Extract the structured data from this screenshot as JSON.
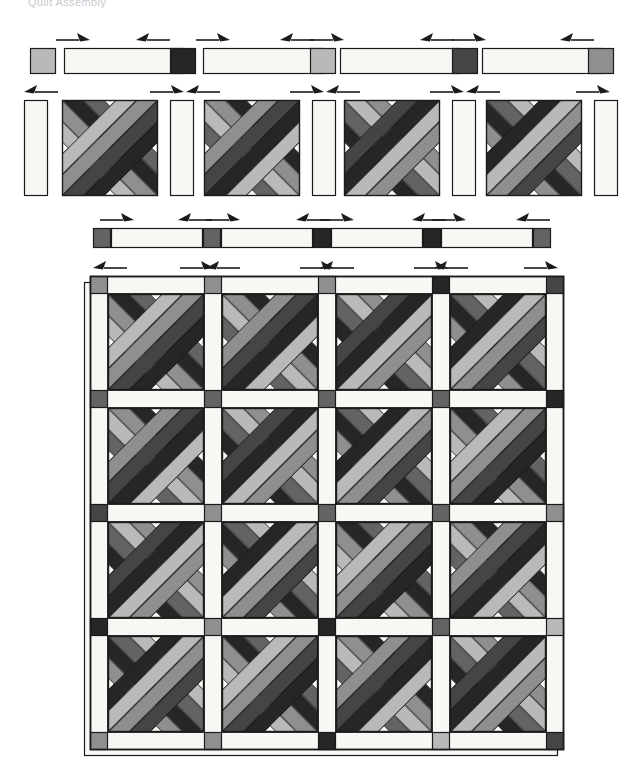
{
  "document": {
    "title": "Quilt Assembly Diagram",
    "caption_partial": "Quilt Assembly",
    "background": "#ffffff",
    "width": 637,
    "height": 761
  },
  "palette": {
    "background": "#ffffff",
    "outline": "#1b1b1b",
    "fabric_white": "#f7f7f4",
    "fabric_offwhite": "#efefea",
    "fabric_light_gray": "#b9b9b9",
    "fabric_medium_gray": "#8f8f8f",
    "fabric_dark_gray": "#636363",
    "fabric_charcoal": "#454545",
    "fabric_black": "#262626",
    "arrow_color": "#1b1b1b"
  },
  "legend": {
    "fabric_names": [
      "white background",
      "light gray",
      "medium gray",
      "dark gray",
      "charcoal",
      "black"
    ]
  },
  "rows": [
    {
      "id": "row-1-sashing-strip",
      "name": "Top sashing row",
      "y": 48,
      "height": 26,
      "pieces": [
        {
          "type": "cornerstone",
          "shade": "fabric_light_gray",
          "x": 30,
          "w": 26
        },
        {
          "type": "sashing",
          "shade": "fabric_white",
          "x": 64,
          "w": 120
        },
        {
          "type": "cornerstone",
          "shade": "fabric_black",
          "x": 170,
          "w": 26
        },
        {
          "type": "sashing",
          "shade": "fabric_white",
          "x": 203,
          "w": 120
        },
        {
          "type": "cornerstone",
          "shade": "fabric_light_gray",
          "x": 310,
          "w": 26
        },
        {
          "type": "sashing",
          "shade": "fabric_white",
          "x": 340,
          "w": 120
        },
        {
          "type": "cornerstone",
          "shade": "fabric_charcoal",
          "x": 452,
          "w": 26
        },
        {
          "type": "sashing",
          "shade": "fabric_white",
          "x": 482,
          "w": 120
        },
        {
          "type": "cornerstone",
          "shade": "fabric_medium_gray",
          "x": 588,
          "w": 26
        }
      ],
      "arrows": [
        {
          "x": 56,
          "y": 40,
          "dir": "right"
        },
        {
          "x": 136,
          "y": 40,
          "dir": "left"
        },
        {
          "x": 196,
          "y": 40,
          "dir": "right"
        },
        {
          "x": 280,
          "y": 40,
          "dir": "left"
        },
        {
          "x": 310,
          "y": 40,
          "dir": "right"
        },
        {
          "x": 420,
          "y": 40,
          "dir": "left"
        },
        {
          "x": 452,
          "y": 40,
          "dir": "right"
        },
        {
          "x": 560,
          "y": 40,
          "dir": "left"
        }
      ]
    },
    {
      "id": "row-2-block-row",
      "name": "Block row with vertical sashing",
      "y": 100,
      "height": 96,
      "pieces": [
        {
          "type": "sashing-vertical",
          "shade": "fabric_white",
          "x": 24,
          "w": 24
        },
        {
          "type": "x-block",
          "variant": 0,
          "x": 62,
          "w": 96
        },
        {
          "type": "sashing-vertical",
          "shade": "fabric_white",
          "x": 170,
          "w": 24
        },
        {
          "type": "x-block",
          "variant": 1,
          "x": 204,
          "w": 96
        },
        {
          "type": "sashing-vertical",
          "shade": "fabric_white",
          "x": 312,
          "w": 24
        },
        {
          "type": "x-block",
          "variant": 2,
          "x": 344,
          "w": 96
        },
        {
          "type": "sashing-vertical",
          "shade": "fabric_white",
          "x": 452,
          "w": 24
        },
        {
          "type": "x-block",
          "variant": 3,
          "x": 486,
          "w": 96
        },
        {
          "type": "sashing-vertical",
          "shade": "fabric_white",
          "x": 594,
          "w": 24
        }
      ],
      "arrows": [
        {
          "x": 24,
          "y": 92,
          "dir": "left"
        },
        {
          "x": 150,
          "y": 92,
          "dir": "right"
        },
        {
          "x": 186,
          "y": 92,
          "dir": "left"
        },
        {
          "x": 290,
          "y": 92,
          "dir": "right"
        },
        {
          "x": 326,
          "y": 92,
          "dir": "left"
        },
        {
          "x": 430,
          "y": 92,
          "dir": "right"
        },
        {
          "x": 466,
          "y": 92,
          "dir": "left"
        },
        {
          "x": 576,
          "y": 92,
          "dir": "right"
        }
      ]
    },
    {
      "id": "row-3-joined-sashing",
      "name": "Joined sashing strip",
      "y": 228,
      "height": 20,
      "pieces": [
        {
          "type": "cornerstone",
          "shade": "fabric_dark_gray",
          "x": 93,
          "w": 18
        },
        {
          "type": "sashing",
          "shade": "fabric_white",
          "x": 111,
          "w": 92
        },
        {
          "type": "cornerstone",
          "shade": "fabric_dark_gray",
          "x": 203,
          "w": 18
        },
        {
          "type": "sashing",
          "shade": "fabric_white",
          "x": 221,
          "w": 92
        },
        {
          "type": "cornerstone",
          "shade": "fabric_black",
          "x": 313,
          "w": 18
        },
        {
          "type": "sashing",
          "shade": "fabric_white",
          "x": 331,
          "w": 92
        },
        {
          "type": "cornerstone",
          "shade": "fabric_black",
          "x": 423,
          "w": 18
        },
        {
          "type": "sashing",
          "shade": "fabric_white",
          "x": 441,
          "w": 92
        },
        {
          "type": "cornerstone",
          "shade": "fabric_dark_gray",
          "x": 533,
          "w": 18
        }
      ],
      "arrows": [
        {
          "x": 100,
          "y": 220,
          "dir": "right"
        },
        {
          "x": 178,
          "y": 220,
          "dir": "left"
        },
        {
          "x": 206,
          "y": 220,
          "dir": "right"
        },
        {
          "x": 296,
          "y": 220,
          "dir": "left"
        },
        {
          "x": 320,
          "y": 220,
          "dir": "right"
        },
        {
          "x": 412,
          "y": 220,
          "dir": "left"
        },
        {
          "x": 432,
          "y": 220,
          "dir": "right"
        },
        {
          "x": 516,
          "y": 220,
          "dir": "left"
        }
      ]
    }
  ],
  "quilt": {
    "id": "main-quilt-assembly",
    "name": "Assembled quilt top",
    "x": 90,
    "y": 276,
    "width": 462,
    "height": 442,
    "grid": {
      "rows": 4,
      "cols": 4
    },
    "block_size": 96,
    "sashing_width": 18,
    "shadow_offset": 6,
    "arrows": [
      {
        "x": 93,
        "y": 268,
        "dir": "left"
      },
      {
        "x": 180,
        "y": 268,
        "dir": "right"
      },
      {
        "x": 206,
        "y": 268,
        "dir": "left"
      },
      {
        "x": 300,
        "y": 268,
        "dir": "right"
      },
      {
        "x": 320,
        "y": 268,
        "dir": "left"
      },
      {
        "x": 414,
        "y": 268,
        "dir": "right"
      },
      {
        "x": 434,
        "y": 268,
        "dir": "left"
      },
      {
        "x": 524,
        "y": 268,
        "dir": "right"
      }
    ],
    "cornerstones": [
      [
        "fabric_medium_gray",
        "fabric_medium_gray",
        "fabric_medium_gray",
        "fabric_black",
        "fabric_charcoal"
      ],
      [
        "fabric_dark_gray",
        "fabric_dark_gray",
        "fabric_dark_gray",
        "fabric_dark_gray",
        "fabric_black"
      ],
      [
        "fabric_charcoal",
        "fabric_medium_gray",
        "fabric_dark_gray",
        "fabric_dark_gray",
        "fabric_medium_gray"
      ],
      [
        "fabric_black",
        "fabric_medium_gray",
        "fabric_black",
        "fabric_dark_gray",
        "fabric_light_gray"
      ],
      [
        "fabric_medium_gray",
        "fabric_medium_gray",
        "fabric_black",
        "fabric_light_gray",
        "fabric_charcoal"
      ]
    ],
    "block_variants": [
      [
        0,
        1,
        2,
        3
      ],
      [
        1,
        2,
        3,
        0
      ],
      [
        2,
        3,
        0,
        1
      ],
      [
        3,
        0,
        1,
        2
      ]
    ]
  },
  "x_block": {
    "name": "Woven X block",
    "description": "Four interlaced diagonal bands forming an X with light corner triangles",
    "band_count": 8,
    "shades_a": [
      "fabric_light_gray",
      "fabric_medium_gray",
      "fabric_charcoal",
      "fabric_black"
    ],
    "shades_b": [
      "fabric_dark_gray",
      "fabric_black",
      "fabric_medium_gray",
      "fabric_light_gray"
    ],
    "corner_shade": "fabric_white"
  }
}
